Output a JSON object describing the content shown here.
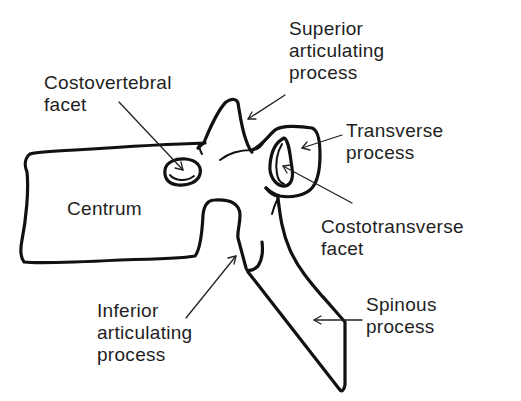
{
  "diagram": {
    "labels": {
      "costovertebral_facet": {
        "line1": "Costovertebral",
        "line2": "facet"
      },
      "superior_articulating_process": {
        "line1": "Superior",
        "line2": "articulating",
        "line3": "process"
      },
      "transverse_process": {
        "line1": "Transverse",
        "line2": "process"
      },
      "centrum": {
        "line1": "Centrum"
      },
      "costotransverse_facet": {
        "line1": "Costotransverse",
        "line2": "facet"
      },
      "inferior_articulating_process": {
        "line1": "Inferior",
        "line2": "articulating",
        "line3": "process"
      },
      "spinous_process": {
        "line1": "Spinous",
        "line2": "process"
      }
    },
    "colors": {
      "ink": "#111111",
      "background": "#ffffff"
    }
  }
}
